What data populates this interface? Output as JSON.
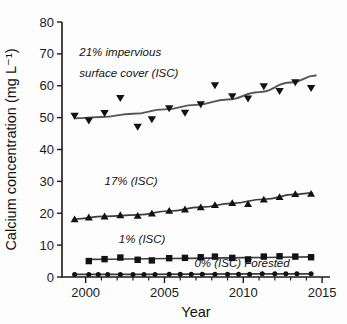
{
  "figure": {
    "title": "",
    "background": "#ffffff",
    "marker_color": "#121212",
    "trend_color": "#55585a"
  },
  "axes": {
    "xlabel": "Year",
    "ylabel": "Calcium concentration (mg L⁻¹)",
    "x_ticklabels": [
      "2000",
      "2005",
      "2010",
      "2015"
    ],
    "y_ticklabels": [
      "0",
      "10",
      "20",
      "30",
      "40",
      "50",
      "60",
      "70",
      "80"
    ]
  },
  "annotations": [
    {
      "name": "annot-21-isc-line1",
      "text": "21% impervious"
    },
    {
      "name": "annot-21-isc-line2",
      "text": "surface cover (ISC)"
    },
    {
      "name": "annot-17-isc",
      "text": "17% (ISC)"
    },
    {
      "name": "annot-1-isc",
      "text": "1% (ISC)"
    },
    {
      "name": "annot-0-isc",
      "text": "0% (ISC) Forested"
    }
  ],
  "chart_data": {
    "type": "scatter",
    "title": "",
    "xlabel": "Year",
    "ylabel": "Calcium concentration (mg L⁻¹)",
    "xlim": [
      1998.5,
      2015.5
    ],
    "ylim": [
      0,
      80
    ],
    "xticks": [
      2000,
      2005,
      2010,
      2015
    ],
    "xticks_minor": [
      2001,
      2002,
      2003,
      2004,
      2006,
      2007,
      2008,
      2009,
      2011,
      2012,
      2013,
      2014
    ],
    "yticks": [
      0,
      10,
      20,
      30,
      40,
      50,
      60,
      70,
      80
    ],
    "grid": false,
    "legend": "inline annotations",
    "series": [
      {
        "name": "21% impervious surface cover (ISC)",
        "label": "21% impervious surface cover (ISC)",
        "marker": "triangle-down",
        "x": [
          1999.3,
          2000.2,
          2001.2,
          2002.2,
          2003.3,
          2004.2,
          2005.3,
          2006.3,
          2007.3,
          2008.2,
          2009.3,
          2010.3,
          2011.3,
          2012.3,
          2013.3,
          2014.3
        ],
        "values": [
          50.5,
          49.0,
          51.3,
          56.0,
          47.0,
          49.4,
          52.8,
          51.4,
          54.1,
          60.0,
          56.6,
          55.9,
          59.7,
          58.2,
          61.0,
          59.2
        ],
        "trend": {
          "x": [
            1999.3,
            2001.0,
            2003.0,
            2005.0,
            2007.0,
            2009.0,
            2011.0,
            2013.0,
            2014.6
          ],
          "y": [
            49.8,
            50.2,
            51.2,
            52.6,
            54.0,
            55.7,
            58.0,
            61.0,
            63.2
          ]
        }
      },
      {
        "name": "17% (ISC)",
        "label": "17% (ISC)",
        "marker": "triangle-up",
        "x": [
          1999.3,
          2000.2,
          2001.2,
          2002.2,
          2003.3,
          2004.2,
          2005.3,
          2006.3,
          2007.3,
          2008.2,
          2009.3,
          2010.3,
          2011.3,
          2012.3,
          2013.3,
          2014.3
        ],
        "values": [
          18.2,
          18.8,
          19.1,
          19.5,
          19.3,
          20.0,
          20.9,
          21.3,
          22.0,
          22.7,
          23.3,
          23.0,
          24.4,
          25.2,
          26.1,
          26.2
        ],
        "trend": {
          "x": [
            1999.3,
            2001.2,
            2003.3,
            2005.3,
            2007.3,
            2009.3,
            2011.3,
            2013.3,
            2014.4
          ],
          "y": [
            18.2,
            19.0,
            19.5,
            20.7,
            21.9,
            23.1,
            24.4,
            25.9,
            26.4
          ]
        }
      },
      {
        "name": "1% (ISC)",
        "label": "1% (ISC)",
        "marker": "square",
        "x": [
          2000.2,
          2001.2,
          2002.2,
          2003.3,
          2004.2,
          2005.3,
          2006.3,
          2007.3,
          2008.2,
          2009.3,
          2010.3,
          2011.3,
          2012.3,
          2013.3,
          2014.3
        ],
        "values": [
          5.0,
          5.6,
          6.1,
          5.4,
          5.2,
          5.9,
          6.0,
          6.2,
          6.4,
          6.0,
          5.5,
          6.4,
          6.5,
          6.4,
          6.2
        ],
        "trend": {
          "x": [
            2000.2,
            2005.3,
            2010.3,
            2014.4
          ],
          "y": [
            5.5,
            5.8,
            6.1,
            6.3
          ]
        }
      },
      {
        "name": "0% (ISC) Forested",
        "label": "0% (ISC) Forested",
        "marker": "circle",
        "x": [
          1999.3,
          2000.2,
          2000.8,
          2001.4,
          2002.2,
          2003.0,
          2003.7,
          2004.4,
          2005.3,
          2006.0,
          2006.7,
          2007.4,
          2008.2,
          2009.0,
          2009.7,
          2010.4,
          2011.2,
          2012.0,
          2012.7,
          2013.4,
          2014.3
        ],
        "values": [
          0.8,
          0.8,
          0.8,
          0.8,
          0.8,
          0.8,
          0.8,
          0.8,
          0.9,
          0.9,
          0.9,
          0.9,
          0.9,
          0.9,
          0.9,
          0.9,
          1.0,
          1.0,
          1.0,
          1.0,
          1.0
        ],
        "trend": {
          "x": [
            1999.3,
            2007.0,
            2014.4
          ],
          "y": [
            0.8,
            0.9,
            1.0
          ]
        }
      }
    ]
  }
}
